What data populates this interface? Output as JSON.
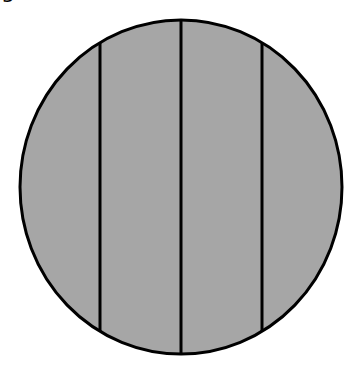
{
  "figure": {
    "cut_label": "g",
    "shape": "circle",
    "partitions": 4,
    "fill_color": "#a6a6a6",
    "stroke_color": "#000000",
    "ellipse": {
      "cx": 181,
      "cy": 187,
      "rx": 161,
      "ry": 167
    },
    "divider_x": [
      100,
      181,
      262
    ]
  }
}
